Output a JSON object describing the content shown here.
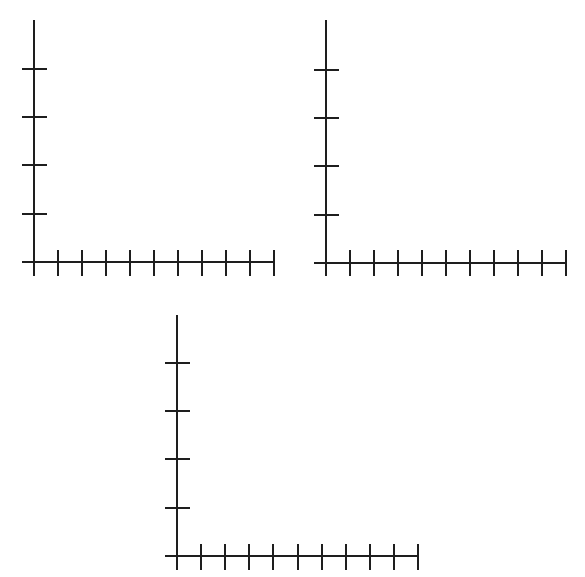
{
  "page": {
    "width": 585,
    "height": 577,
    "background": "#ffffff",
    "line_color": "#1e1e1e"
  },
  "chart_data": [
    {
      "type": "line",
      "title": "",
      "xlabel": "",
      "ylabel": "",
      "series": [],
      "x_ticks": 10,
      "y_ticks": 4,
      "tick_labels_x": [],
      "tick_labels_y": [],
      "grid": false,
      "legend": null,
      "geometry": {
        "origin_x": 34,
        "origin_y": 262,
        "y_axis_top": 20,
        "x_axis_left": 22,
        "x_axis_right": 274,
        "x_tick_spacing": 24,
        "y_tick_spacing": 48.3,
        "y_tick_left": 22,
        "y_tick_right": 47,
        "x_tick_top": 250,
        "x_tick_bottom": 276
      }
    },
    {
      "type": "line",
      "title": "",
      "xlabel": "",
      "ylabel": "",
      "series": [],
      "x_ticks": 10,
      "y_ticks": 4,
      "tick_labels_x": [],
      "tick_labels_y": [],
      "grid": false,
      "legend": null,
      "geometry": {
        "origin_x": 326,
        "origin_y": 263,
        "y_axis_top": 20,
        "x_axis_left": 314,
        "x_axis_right": 566,
        "x_tick_spacing": 24,
        "y_tick_spacing": 48.3,
        "y_tick_left": 314,
        "y_tick_right": 339,
        "x_tick_top": 250,
        "x_tick_bottom": 276
      }
    },
    {
      "type": "line",
      "title": "",
      "xlabel": "",
      "ylabel": "",
      "series": [],
      "x_ticks": 10,
      "y_ticks": 4,
      "tick_labels_x": [],
      "tick_labels_y": [],
      "grid": false,
      "legend": null,
      "geometry": {
        "origin_x": 177,
        "origin_y": 556,
        "y_axis_top": 315,
        "x_axis_left": 165,
        "x_axis_right": 418,
        "x_tick_spacing": 24.1,
        "y_tick_spacing": 48.3,
        "y_tick_left": 165,
        "y_tick_right": 190,
        "x_tick_top": 544,
        "x_tick_bottom": 570
      }
    }
  ]
}
